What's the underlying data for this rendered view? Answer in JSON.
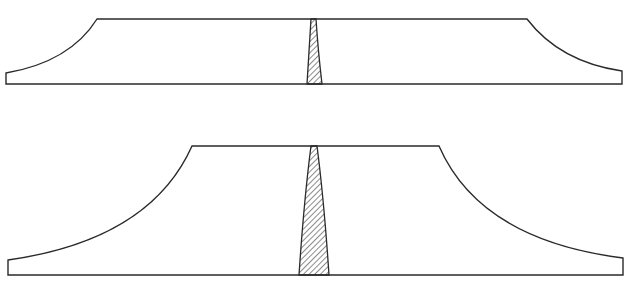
{
  "figure": {
    "type": "cross-section diagram",
    "panels": [
      {
        "id": "top",
        "description": "Shallow profile with concave flanks and a narrow hatched wedge at center",
        "top_edge": {
          "x1": 97,
          "x2": 527,
          "y": 19
        },
        "base": {
          "x1": 6,
          "x2": 622,
          "y": 84
        },
        "left_end": {
          "x": 6,
          "y_top": 73
        },
        "right_end": {
          "x": 622,
          "y_top": 71
        },
        "wedge": {
          "top_x1": 311,
          "top_x2": 316,
          "top_y": 19,
          "bottom_x1": 307,
          "bottom_x2": 322,
          "bottom_y": 84
        }
      },
      {
        "id": "bottom",
        "description": "Taller profile with concave flanks and a wider hatched wedge at center",
        "top_edge": {
          "x1": 192,
          "x2": 439,
          "y": 146
        },
        "base": {
          "x1": 8,
          "x2": 623,
          "y": 275
        },
        "left_end": {
          "x": 8,
          "y_top": 260
        },
        "right_end": {
          "x": 623,
          "y_top": 258
        },
        "wedge": {
          "top_x1": 311,
          "top_x2": 317,
          "top_y": 146,
          "bottom_x1": 299,
          "bottom_x2": 329,
          "bottom_y": 275
        }
      }
    ],
    "colors": {
      "line": "#2a2a2a",
      "background": "#ffffff"
    }
  },
  "caption": ""
}
